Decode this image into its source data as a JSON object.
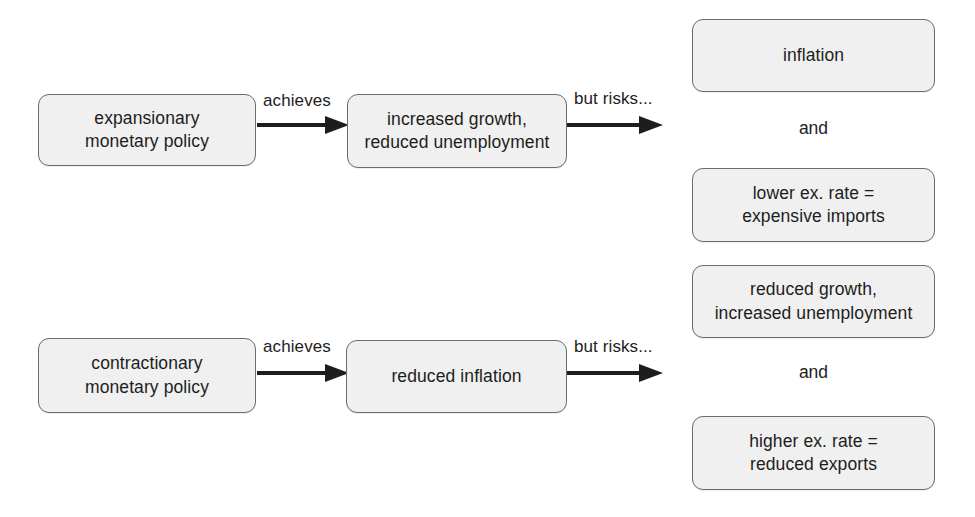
{
  "diagram": {
    "colors": {
      "box_fill": "#f0f0f0",
      "box_border": "#6b6b6b",
      "text": "#1d1d1d",
      "arrow": "#1d1d1d",
      "background": "#ffffff"
    },
    "nodes": [
      {
        "id": "expansionary-policy",
        "label": "expansionary\nmonetary policy"
      },
      {
        "id": "increased-growth",
        "label": "increased growth,\nreduced unemployment"
      },
      {
        "id": "inflation",
        "label": "inflation"
      },
      {
        "id": "lower-ex-rate",
        "label": "lower ex. rate =\nexpensive imports"
      },
      {
        "id": "contractionary-policy",
        "label": "contractionary\nmonetary policy"
      },
      {
        "id": "reduced-inflation",
        "label": "reduced inflation"
      },
      {
        "id": "reduced-growth",
        "label": "reduced growth,\nincreased unemployment"
      },
      {
        "id": "higher-ex-rate",
        "label": "higher ex. rate =\nreduced exports"
      }
    ],
    "edges": [
      {
        "id": "expansionary-achieves",
        "label": "achieves"
      },
      {
        "id": "expansionary-but-risks",
        "label": "but risks..."
      },
      {
        "id": "contractionary-achieves",
        "label": "achieves"
      },
      {
        "id": "contractionary-but-risks",
        "label": "but risks..."
      }
    ],
    "joiners": [
      {
        "id": "joiner-top",
        "label": "and"
      },
      {
        "id": "joiner-bottom",
        "label": "and"
      }
    ]
  }
}
